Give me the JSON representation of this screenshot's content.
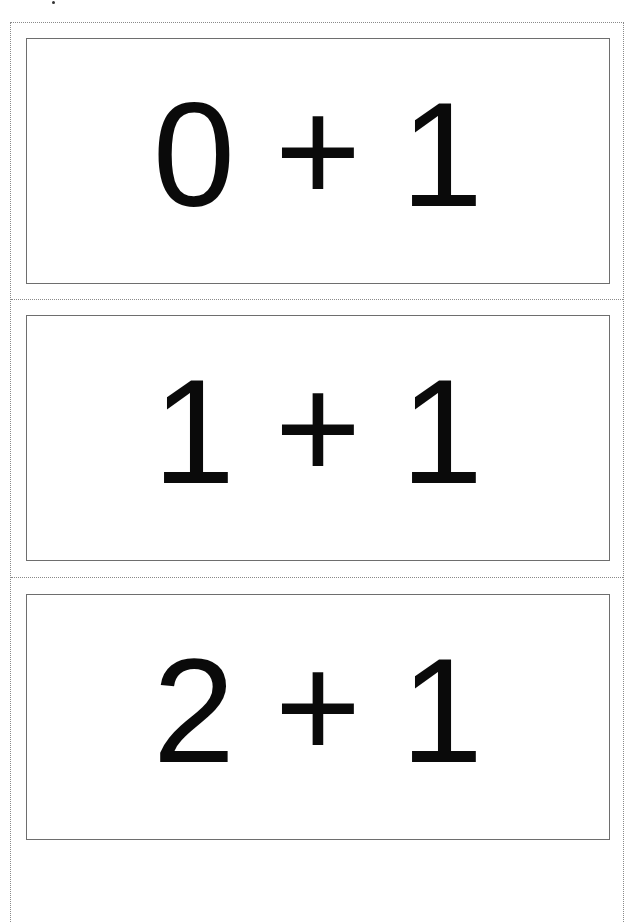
{
  "page": {
    "type": "printable-flashcards",
    "cards": [
      {
        "left": "0",
        "operator": "+",
        "right": "1"
      },
      {
        "left": "1",
        "operator": "+",
        "right": "1"
      },
      {
        "left": "2",
        "operator": "+",
        "right": "1"
      }
    ]
  },
  "colors": {
    "background": "#ffffff",
    "text": "#0a0a0a",
    "card_border": "#6e6e6e",
    "cut_line": "#8a8a8a"
  }
}
